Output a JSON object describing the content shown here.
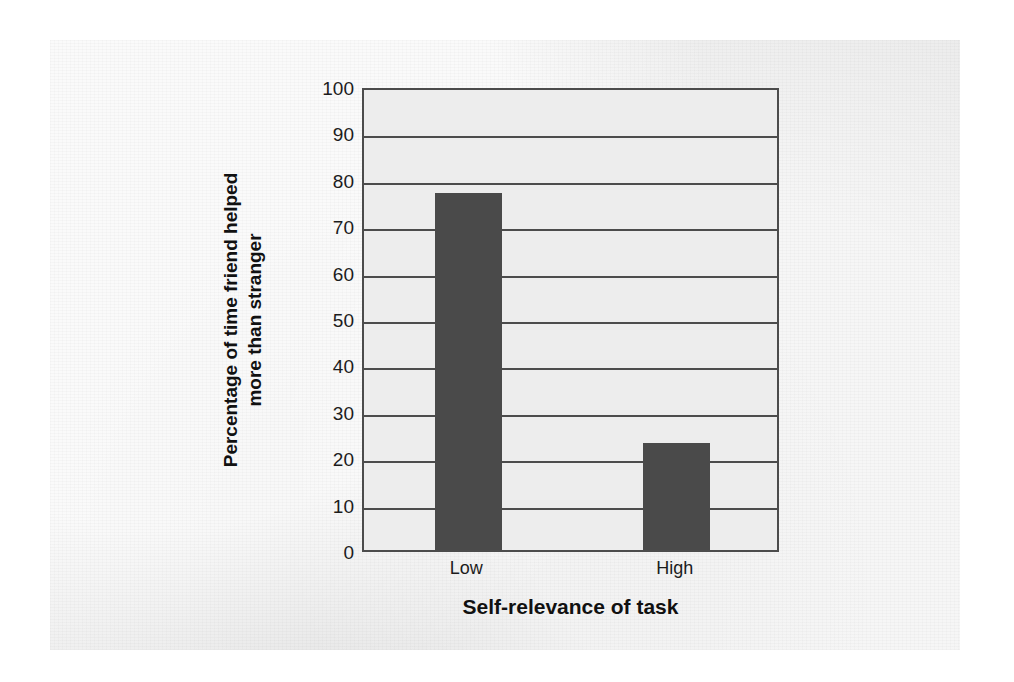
{
  "chart_data": {
    "type": "bar",
    "title": "",
    "categories": [
      "Low",
      "High"
    ],
    "values": [
      77,
      23
    ],
    "series": [
      {
        "name": "Percentage of time friend helped more than stranger",
        "values": [
          77,
          23
        ]
      }
    ],
    "xlabel": "Self-relevance of task",
    "ylabel": "Percentage of time friend helped\nmore than stranger",
    "ylim": [
      0,
      100
    ],
    "ytick_labels": [
      "0",
      "10",
      "20",
      "30",
      "40",
      "50",
      "60",
      "70",
      "80",
      "90",
      "100"
    ],
    "ytick_values": [
      0,
      10,
      20,
      30,
      40,
      50,
      60,
      70,
      80,
      90,
      100
    ],
    "grid": true,
    "legend": false,
    "bar_color": "#4a4a4a",
    "axis_color": "#4c4c4c",
    "plot_background": "#ededed"
  },
  "figure": {
    "page_background": "#ffffff",
    "panel_background": "#ececec"
  }
}
